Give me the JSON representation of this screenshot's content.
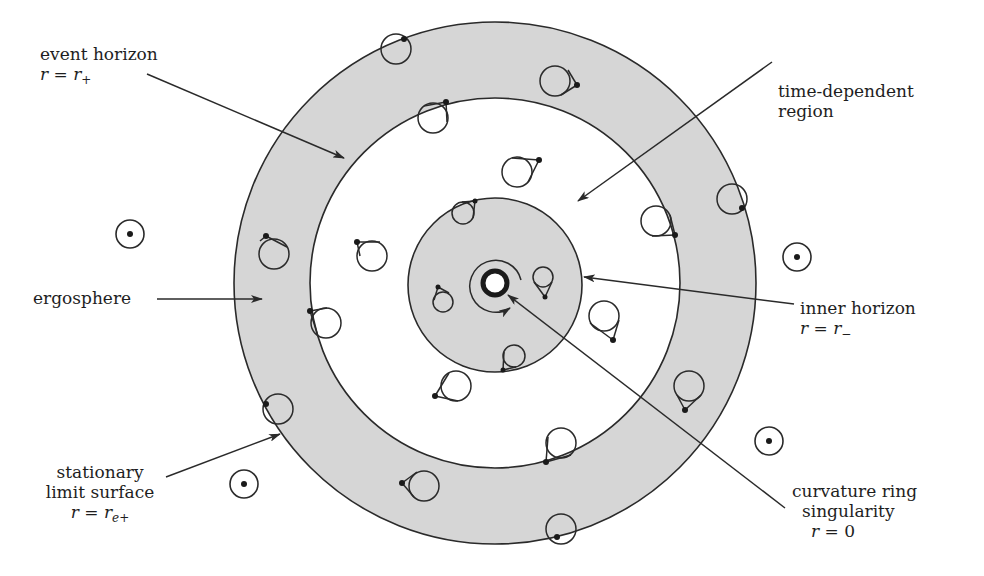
{
  "diagram": {
    "colors": {
      "background": "#ffffff",
      "shaded_region": "#d6d6d6",
      "stroke": "#2a2a2a",
      "text": "#1e1e1e"
    },
    "geometry": {
      "center": [
        495,
        283
      ],
      "stationary_limit_radius": 261,
      "event_horizon_radius": 185,
      "inner_horizon_radius": 87,
      "singularity_radius": 12
    }
  },
  "labels": {
    "event_horizon": {
      "line1": "event horizon",
      "eq_lhs": "r",
      "eq_op": " = ",
      "eq_rhs": "r",
      "eq_sub": "+"
    },
    "time_dependent_region": {
      "line1": "time-dependent",
      "line2": "region"
    },
    "ergosphere": {
      "line1": "ergosphere"
    },
    "inner_horizon": {
      "line1": "inner horizon",
      "eq_lhs": "r",
      "eq_op": " = ",
      "eq_rhs": "r",
      "eq_sub": "−"
    },
    "stationary_limit_surface": {
      "line1": "stationary",
      "line2": "limit surface",
      "eq_lhs": "r",
      "eq_op": " = ",
      "eq_rhs": "r",
      "eq_sub": "e+"
    },
    "ring_singularity": {
      "line1": "curvature ring",
      "line2": "singularity",
      "eq_lhs": "r",
      "eq_op": " = ",
      "eq_rhs": "0"
    }
  },
  "light_cones_static": [
    {
      "cx": 130,
      "cy": 234
    },
    {
      "cx": 797,
      "cy": 257
    },
    {
      "cx": 769,
      "cy": 441
    },
    {
      "cx": 244,
      "cy": 484
    }
  ]
}
